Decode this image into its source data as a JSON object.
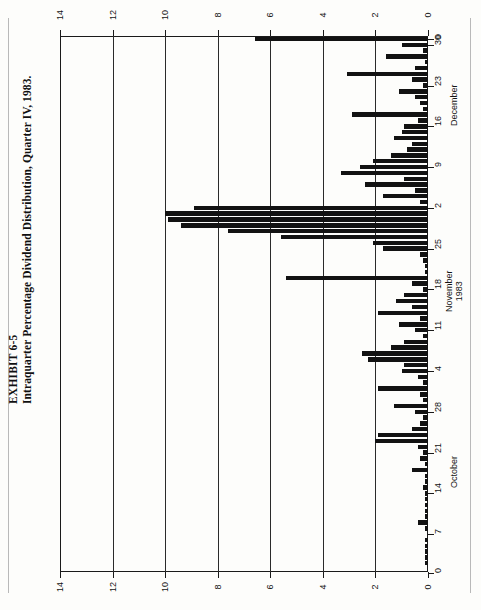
{
  "exhibit": {
    "number": "EXHIBIT 6-5",
    "title": "Intraquarter Percentage Dividend Distribution, Quarter IV, 1983."
  },
  "chart_data": {
    "type": "bar",
    "orientation": "horizontal",
    "title": "Intraquarter Percentage Dividend Distribution, Quarter IV, 1983.",
    "xlabel": "",
    "ylabel": "",
    "value_axis": {
      "min": 0,
      "max": 14,
      "ticks": [
        0,
        2,
        4,
        6,
        8,
        10,
        12,
        14
      ],
      "tick_labels": [
        "0",
        "2",
        "4",
        "6",
        "8",
        "10",
        "12",
        "14"
      ],
      "direction": "right-to-left",
      "position": "top-and-bottom"
    },
    "category_axis": {
      "position": "right",
      "month_labels": [
        "October",
        "November 1983",
        "December"
      ],
      "tick_labels": [
        "0",
        "7",
        "14",
        "21",
        "28",
        "4",
        "11",
        "18",
        "25",
        "2",
        "9",
        "16",
        "23",
        "30",
        "0"
      ],
      "grid": true
    },
    "categories": [
      "Oct 1",
      "Oct 2",
      "Oct 3",
      "Oct 4",
      "Oct 5",
      "Oct 6",
      "Oct 7",
      "Oct 8",
      "Oct 9",
      "Oct 10",
      "Oct 11",
      "Oct 12",
      "Oct 13",
      "Oct 14",
      "Oct 15",
      "Oct 16",
      "Oct 17",
      "Oct 18",
      "Oct 19",
      "Oct 20",
      "Oct 21",
      "Oct 22",
      "Oct 23",
      "Oct 24",
      "Oct 25",
      "Oct 26",
      "Oct 27",
      "Oct 28",
      "Oct 29",
      "Oct 30",
      "Oct 31",
      "Nov 1",
      "Nov 2",
      "Nov 3",
      "Nov 4",
      "Nov 5",
      "Nov 6",
      "Nov 7",
      "Nov 8",
      "Nov 9",
      "Nov 10",
      "Nov 11",
      "Nov 12",
      "Nov 13",
      "Nov 14",
      "Nov 15",
      "Nov 16",
      "Nov 17",
      "Nov 18",
      "Nov 19",
      "Nov 20",
      "Nov 21",
      "Nov 22",
      "Nov 23",
      "Nov 24",
      "Nov 25",
      "Nov 26",
      "Nov 27",
      "Nov 28",
      "Nov 29",
      "Nov 30",
      "Dec 1",
      "Dec 2",
      "Dec 3",
      "Dec 4",
      "Dec 5",
      "Dec 6",
      "Dec 7",
      "Dec 8",
      "Dec 9",
      "Dec 10",
      "Dec 11",
      "Dec 12",
      "Dec 13",
      "Dec 14",
      "Dec 15",
      "Dec 16",
      "Dec 17",
      "Dec 18",
      "Dec 19",
      "Dec 20",
      "Dec 21",
      "Dec 22",
      "Dec 23",
      "Dec 24",
      "Dec 25",
      "Dec 26",
      "Dec 27",
      "Dec 28",
      "Dec 29",
      "Dec 30",
      "Dec 31"
    ],
    "values": [
      6.6,
      1.0,
      0.2,
      1.6,
      0.1,
      0.5,
      3.1,
      0.6,
      0.2,
      1.1,
      0.5,
      0.3,
      0.2,
      2.9,
      0.4,
      0.9,
      1.0,
      1.3,
      0.6,
      0.8,
      1.4,
      2.1,
      2.6,
      3.3,
      0.9,
      2.4,
      0.5,
      1.7,
      0.3,
      8.9,
      10.0,
      9.9,
      9.4,
      7.6,
      5.6,
      2.1,
      1.7,
      0.3,
      0.2,
      0.1,
      0.1,
      5.4,
      0.6,
      0.2,
      0.9,
      1.2,
      0.6,
      1.9,
      0.3,
      1.1,
      0.5,
      0.2,
      0.9,
      1.4,
      2.5,
      2.3,
      0.9,
      1.0,
      0.4,
      0.2,
      1.9,
      0.3,
      0.2,
      1.3,
      0.5,
      0.2,
      0.3,
      0.6,
      1.9,
      2.0,
      0.4,
      0.2,
      0.3,
      0.1,
      0.6,
      0.1,
      0.1,
      0.2,
      0.1,
      0.1,
      0.1,
      0.1,
      0.1,
      0.4,
      0.1,
      0.0,
      0.1,
      0.1,
      0.1,
      0.1,
      0.1,
      0.0
    ]
  }
}
